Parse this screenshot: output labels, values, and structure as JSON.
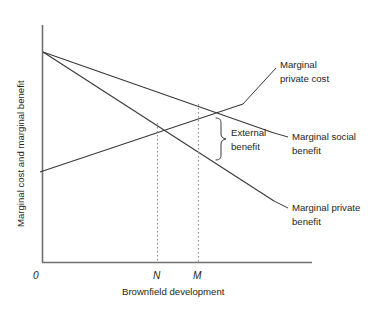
{
  "figure": {
    "kind": "economics-externality-diagram",
    "background": "#ffffff",
    "ink": "#231f20",
    "axis_color": "#6f7072",
    "curve_color": "#3a3a3c",
    "dash_color": "#8a8a8c"
  },
  "axes": {
    "y_label": "Marginal cost and marginal benefit",
    "x_label": "Brownfield development",
    "origin_label": "0"
  },
  "ticks": {
    "x": [
      {
        "label": "N",
        "x": 157
      },
      {
        "label": "M",
        "x": 198
      }
    ]
  },
  "curves": [
    {
      "name": "marginal-private-cost",
      "label_line1": "Marginal",
      "label_line2": "private cost",
      "direction": "upward-sloping",
      "from": [
        40,
        172
      ],
      "to": [
        243,
        104
      ]
    },
    {
      "name": "marginal-social-benefit",
      "label_line1": "Marginal social",
      "label_line2": "benefit",
      "direction": "downward-sloping",
      "from": [
        43,
        52
      ],
      "to": [
        274,
        133
      ]
    },
    {
      "name": "marginal-private-benefit",
      "label_line1": "Marginal private",
      "label_line2": "benefit",
      "direction": "downward-sloping-steeper",
      "from": [
        43,
        52
      ],
      "to": [
        274,
        201
      ]
    }
  ],
  "annotation": {
    "brace_label_line1": "External",
    "brace_label_line2": "benefit"
  }
}
